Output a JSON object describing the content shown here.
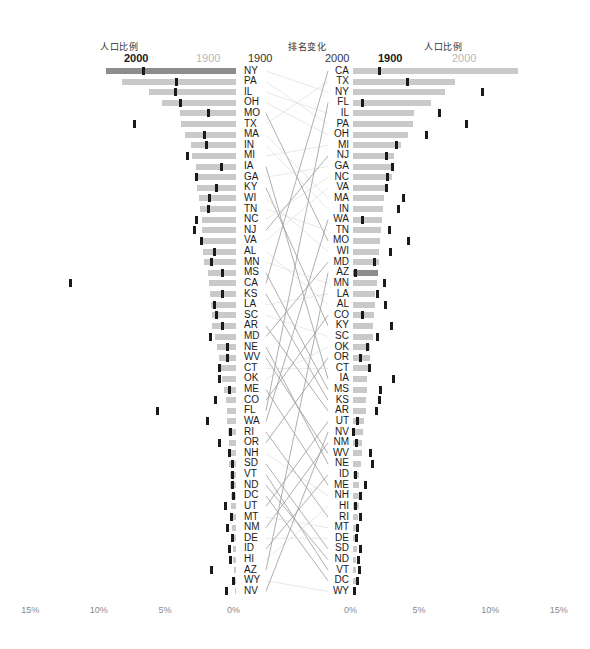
{
  "headers": {
    "left_title": "人口比例",
    "middle_title": "排名变化",
    "right_title": "人口比例",
    "left_bold_year": "2000",
    "left_light_year": "1900",
    "rank_left_year": "1900",
    "rank_right_year": "2000",
    "right_bold_year": "1900",
    "right_light_year": "2000"
  },
  "axis": {
    "left_ticks": [
      "15%",
      "10%",
      "5%",
      "0%"
    ],
    "right_ticks": [
      "0%",
      "5%",
      "10%",
      "15%"
    ]
  },
  "colors": {
    "bar": "#c9c9c9",
    "bar_highlight": "#8d8d8d",
    "tick": "#1a1a1a",
    "link": "#bbbbbb",
    "axis_text": "#8a8a8a",
    "light_year": "#b8b8b8"
  },
  "chart_data": {
    "type": "bar",
    "xlabel": "",
    "ylabel": "",
    "xlim_left": [
      0,
      15
    ],
    "xlim_right": [
      0,
      15
    ],
    "grid": false,
    "legend_position": "top",
    "series": [
      {
        "name": "1900",
        "label": "1900"
      },
      {
        "name": "2000",
        "label": "2000"
      }
    ],
    "left_panel": {
      "sorted_by": "1900",
      "bar_series": "1900",
      "tick_series": "2000",
      "rows": [
        {
          "state": "NY",
          "rank1900": 1,
          "rank2000": 3,
          "pct1900": 9.47,
          "pct2000": 6.74
        },
        {
          "state": "PA",
          "rank1900": 2,
          "rank2000": 6,
          "pct1900": 8.28,
          "pct2000": 4.37
        },
        {
          "state": "IL",
          "rank1900": 3,
          "rank2000": 5,
          "pct1900": 6.33,
          "pct2000": 4.41
        },
        {
          "state": "OH",
          "rank1900": 4,
          "rank2000": 7,
          "pct1900": 5.39,
          "pct2000": 4.03
        },
        {
          "state": "MO",
          "rank1900": 5,
          "rank2000": 17,
          "pct1900": 4.08,
          "pct2000": 1.99
        },
        {
          "state": "TX",
          "rank1900": 6,
          "rank2000": 2,
          "pct1900": 4.0,
          "pct2000": 7.41
        },
        {
          "state": "MA",
          "rank1900": 7,
          "rank2000": 13,
          "pct1900": 3.69,
          "pct2000": 2.26
        },
        {
          "state": "IN",
          "rank1900": 8,
          "rank2000": 14,
          "pct1900": 3.31,
          "pct2000": 2.16
        },
        {
          "state": "MI",
          "rank1900": 9,
          "rank2000": 8,
          "pct1900": 3.18,
          "pct2000": 3.53
        },
        {
          "state": "IA",
          "rank1900": 10,
          "rank2000": 30,
          "pct1900": 2.94,
          "pct2000": 1.04
        },
        {
          "state": "GA",
          "rank1900": 11,
          "rank2000": 10,
          "pct1900": 2.9,
          "pct2000": 2.91
        },
        {
          "state": "KY",
          "rank1900": 12,
          "rank2000": 25,
          "pct1900": 2.83,
          "pct2000": 1.44
        },
        {
          "state": "WI",
          "rank1900": 13,
          "rank2000": 18,
          "pct1900": 2.73,
          "pct2000": 1.91
        },
        {
          "state": "TN",
          "rank1900": 14,
          "rank2000": 16,
          "pct1900": 2.66,
          "pct2000": 2.02
        },
        {
          "state": "NC",
          "rank1900": 15,
          "rank2000": 11,
          "pct1900": 2.51,
          "pct2000": 2.86
        },
        {
          "state": "NJ",
          "rank1900": 16,
          "rank2000": 9,
          "pct1900": 2.47,
          "pct2000": 2.99
        },
        {
          "state": "VA",
          "rank1900": 17,
          "rank2000": 12,
          "pct1900": 2.44,
          "pct2000": 2.52
        },
        {
          "state": "AL",
          "rank1900": 18,
          "rank2000": 23,
          "pct1900": 2.38,
          "pct2000": 1.58
        },
        {
          "state": "MN",
          "rank1900": 19,
          "rank2000": 21,
          "pct1900": 2.3,
          "pct2000": 1.75
        },
        {
          "state": "MS",
          "rank1900": 20,
          "rank2000": 31,
          "pct1900": 2.04,
          "pct2000": 1.01
        },
        {
          "state": "CA",
          "rank1900": 21,
          "rank2000": 1,
          "pct1900": 1.95,
          "pct2000": 12.05
        },
        {
          "state": "KS",
          "rank1900": 22,
          "rank2000": 32,
          "pct1900": 1.93,
          "pct2000": 0.95
        },
        {
          "state": "LA",
          "rank1900": 23,
          "rank2000": 22,
          "pct1900": 1.82,
          "pct2000": 1.59
        },
        {
          "state": "SC",
          "rank1900": 24,
          "rank2000": 26,
          "pct1900": 1.75,
          "pct2000": 1.43
        },
        {
          "state": "AR",
          "rank1900": 25,
          "rank2000": 33,
          "pct1900": 1.73,
          "pct2000": 0.95
        },
        {
          "state": "MD",
          "rank1900": 26,
          "rank2000": 19,
          "pct1900": 1.55,
          "pct2000": 1.88
        },
        {
          "state": "NE",
          "rank1900": 27,
          "rank2000": 38,
          "pct1900": 1.4,
          "pct2000": 0.61
        },
        {
          "state": "WV",
          "rank1900": 28,
          "rank2000": 37,
          "pct1900": 1.25,
          "pct2000": 0.64
        },
        {
          "state": "CT",
          "rank1900": 29,
          "rank2000": 29,
          "pct1900": 1.19,
          "pct2000": 1.21
        },
        {
          "state": "OK",
          "rank1900": 30,
          "rank2000": 27,
          "pct1900": 1.04,
          "pct2000": 1.23
        },
        {
          "state": "ME",
          "rank1900": 31,
          "rank2000": 40,
          "pct1900": 0.91,
          "pct2000": 0.45
        },
        {
          "state": "CO",
          "rank1900": 32,
          "rank2000": 24,
          "pct1900": 0.71,
          "pct2000": 1.53
        },
        {
          "state": "FL",
          "rank1900": 33,
          "rank2000": 4,
          "pct1900": 0.68,
          "pct2000": 5.69
        },
        {
          "state": "WA",
          "rank1900": 34,
          "rank2000": 15,
          "pct1900": 0.67,
          "pct2000": 2.1
        },
        {
          "state": "RI",
          "rank1900": 35,
          "rank2000": 43,
          "pct1900": 0.57,
          "pct2000": 0.37
        },
        {
          "state": "OR",
          "rank1900": 36,
          "rank2000": 28,
          "pct1900": 0.54,
          "pct2000": 1.22
        },
        {
          "state": "NH",
          "rank1900": 37,
          "rank2000": 41,
          "pct1900": 0.54,
          "pct2000": 0.44
        },
        {
          "state": "SD",
          "rank1900": 38,
          "rank2000": 46,
          "pct1900": 0.52,
          "pct2000": 0.27
        },
        {
          "state": "VT",
          "rank1900": 39,
          "rank2000": 49,
          "pct1900": 0.45,
          "pct2000": 0.22
        },
        {
          "state": "ND",
          "rank1900": 40,
          "rank2000": 47,
          "pct1900": 0.42,
          "pct2000": 0.23
        },
        {
          "state": "DC",
          "rank1900": 41,
          "rank2000": 50,
          "pct1900": 0.36,
          "pct2000": 0.2
        },
        {
          "state": "UT",
          "rank1900": 42,
          "rank2000": 34,
          "pct1900": 0.36,
          "pct2000": 0.79
        },
        {
          "state": "MT",
          "rank1900": 43,
          "rank2000": 44,
          "pct1900": 0.32,
          "pct2000": 0.32
        },
        {
          "state": "NM",
          "rank1900": 44,
          "rank2000": 36,
          "pct1900": 0.26,
          "pct2000": 0.65
        },
        {
          "state": "DE",
          "rank1900": 45,
          "rank2000": 45,
          "pct1900": 0.24,
          "pct2000": 0.28
        },
        {
          "state": "ID",
          "rank1900": 46,
          "rank2000": 39,
          "pct1900": 0.21,
          "pct2000": 0.46
        },
        {
          "state": "HI",
          "rank1900": 47,
          "rank2000": 42,
          "pct1900": 0.2,
          "pct2000": 0.43
        },
        {
          "state": "AZ",
          "rank1900": 48,
          "rank2000": 20,
          "pct1900": 0.16,
          "pct2000": 1.82
        },
        {
          "state": "WY",
          "rank1900": 49,
          "rank2000": 51,
          "pct1900": 0.12,
          "pct2000": 0.18
        },
        {
          "state": "NV",
          "rank1900": 50,
          "rank2000": 35,
          "pct1900": 0.06,
          "pct2000": 0.71
        }
      ]
    },
    "right_panel": {
      "sorted_by": "2000",
      "bar_series": "2000",
      "tick_series": "1900",
      "rows": [
        {
          "state": "CA",
          "rank2000": 1,
          "pct2000": 12.05,
          "pct1900": 1.95
        },
        {
          "state": "TX",
          "rank2000": 2,
          "pct2000": 7.41,
          "pct1900": 4.0
        },
        {
          "state": "NY",
          "rank2000": 3,
          "pct2000": 6.74,
          "pct1900": 9.47
        },
        {
          "state": "FL",
          "rank2000": 4,
          "pct2000": 5.69,
          "pct1900": 0.68
        },
        {
          "state": "IL",
          "rank2000": 5,
          "pct2000": 4.41,
          "pct1900": 6.33
        },
        {
          "state": "PA",
          "rank2000": 6,
          "pct2000": 4.37,
          "pct1900": 8.28
        },
        {
          "state": "OH",
          "rank2000": 7,
          "pct2000": 4.03,
          "pct1900": 5.39
        },
        {
          "state": "MI",
          "rank2000": 8,
          "pct2000": 3.53,
          "pct1900": 3.18
        },
        {
          "state": "NJ",
          "rank2000": 9,
          "pct2000": 2.99,
          "pct1900": 2.47
        },
        {
          "state": "GA",
          "rank2000": 10,
          "pct2000": 2.91,
          "pct1900": 2.9
        },
        {
          "state": "NC",
          "rank2000": 11,
          "pct2000": 2.86,
          "pct1900": 2.51
        },
        {
          "state": "VA",
          "rank2000": 12,
          "pct2000": 2.52,
          "pct1900": 2.44
        },
        {
          "state": "MA",
          "rank2000": 13,
          "pct2000": 2.26,
          "pct1900": 3.69
        },
        {
          "state": "IN",
          "rank2000": 14,
          "pct2000": 2.16,
          "pct1900": 3.31
        },
        {
          "state": "WA",
          "rank2000": 15,
          "pct2000": 2.1,
          "pct1900": 0.67
        },
        {
          "state": "TN",
          "rank2000": 16,
          "pct2000": 2.02,
          "pct1900": 2.66
        },
        {
          "state": "MO",
          "rank2000": 17,
          "pct2000": 1.99,
          "pct1900": 4.08
        },
        {
          "state": "WI",
          "rank2000": 18,
          "pct2000": 1.91,
          "pct1900": 2.73
        },
        {
          "state": "MD",
          "rank2000": 19,
          "pct2000": 1.88,
          "pct1900": 1.55
        },
        {
          "state": "AZ",
          "rank2000": 20,
          "pct2000": 1.82,
          "pct1900": 0.16
        },
        {
          "state": "MN",
          "rank2000": 21,
          "pct2000": 1.75,
          "pct1900": 2.3
        },
        {
          "state": "LA",
          "rank2000": 22,
          "pct2000": 1.59,
          "pct1900": 1.82
        },
        {
          "state": "AL",
          "rank2000": 23,
          "pct2000": 1.58,
          "pct1900": 2.38
        },
        {
          "state": "CO",
          "rank2000": 24,
          "pct2000": 1.53,
          "pct1900": 0.71
        },
        {
          "state": "KY",
          "rank2000": 25,
          "pct2000": 1.44,
          "pct1900": 2.83
        },
        {
          "state": "SC",
          "rank2000": 26,
          "pct2000": 1.43,
          "pct1900": 1.75
        },
        {
          "state": "OK",
          "rank2000": 27,
          "pct2000": 1.23,
          "pct1900": 1.04
        },
        {
          "state": "OR",
          "rank2000": 28,
          "pct2000": 1.22,
          "pct1900": 0.54
        },
        {
          "state": "CT",
          "rank2000": 29,
          "pct2000": 1.21,
          "pct1900": 1.19
        },
        {
          "state": "IA",
          "rank2000": 30,
          "pct2000": 1.04,
          "pct1900": 2.94
        },
        {
          "state": "MS",
          "rank2000": 31,
          "pct2000": 1.01,
          "pct1900": 2.04
        },
        {
          "state": "KS",
          "rank2000": 32,
          "pct2000": 0.95,
          "pct1900": 1.93
        },
        {
          "state": "AR",
          "rank2000": 33,
          "pct2000": 0.95,
          "pct1900": 1.73
        },
        {
          "state": "UT",
          "rank2000": 34,
          "pct2000": 0.79,
          "pct1900": 0.36
        },
        {
          "state": "NV",
          "rank2000": 35,
          "pct2000": 0.71,
          "pct1900": 0.06
        },
        {
          "state": "NM",
          "rank2000": 36,
          "pct2000": 0.65,
          "pct1900": 0.26
        },
        {
          "state": "WV",
          "rank2000": 37,
          "pct2000": 0.64,
          "pct1900": 1.25
        },
        {
          "state": "NE",
          "rank2000": 38,
          "pct2000": 0.61,
          "pct1900": 1.4
        },
        {
          "state": "ID",
          "rank2000": 39,
          "pct2000": 0.46,
          "pct1900": 0.21
        },
        {
          "state": "ME",
          "rank2000": 40,
          "pct2000": 0.45,
          "pct1900": 0.91
        },
        {
          "state": "NH",
          "rank2000": 41,
          "pct2000": 0.44,
          "pct1900": 0.54
        },
        {
          "state": "HI",
          "rank2000": 42,
          "pct2000": 0.43,
          "pct1900": 0.2
        },
        {
          "state": "RI",
          "rank2000": 43,
          "pct2000": 0.37,
          "pct1900": 0.57
        },
        {
          "state": "MT",
          "rank2000": 44,
          "pct2000": 0.32,
          "pct1900": 0.32
        },
        {
          "state": "DE",
          "rank2000": 45,
          "pct2000": 0.28,
          "pct1900": 0.24
        },
        {
          "state": "SD",
          "rank2000": 46,
          "pct2000": 0.27,
          "pct1900": 0.52
        },
        {
          "state": "ND",
          "rank2000": 47,
          "pct2000": 0.23,
          "pct1900": 0.42
        },
        {
          "state": "VT",
          "rank2000": 49,
          "pct2000": 0.22,
          "pct1900": 0.45
        },
        {
          "state": "DC",
          "rank2000": 50,
          "pct2000": 0.2,
          "pct1900": 0.36
        },
        {
          "state": "WY",
          "rank2000": 51,
          "pct2000": 0.18,
          "pct1900": 0.12
        }
      ]
    }
  }
}
